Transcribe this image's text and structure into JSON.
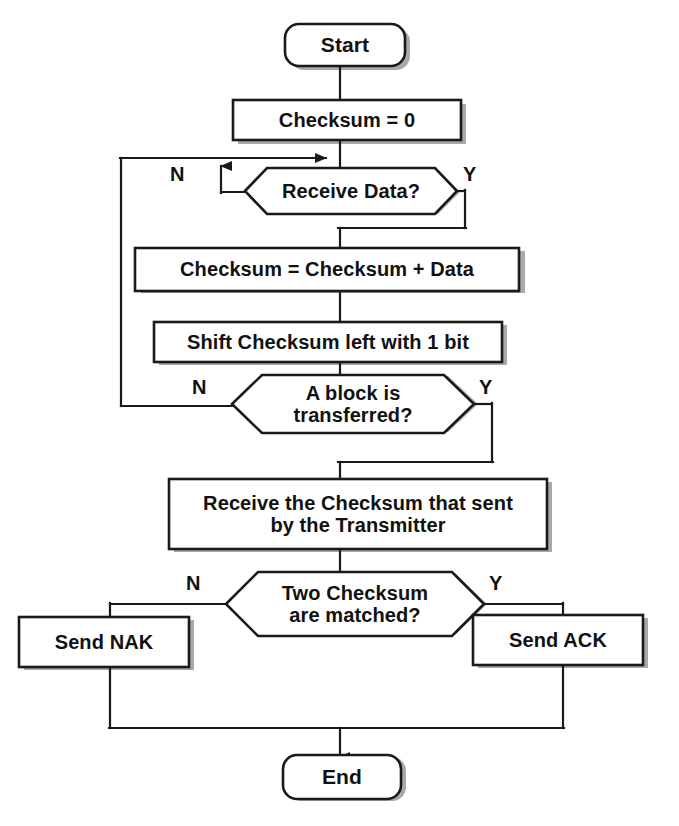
{
  "diagram": {
    "type": "flowchart",
    "colors": {
      "stroke": "#1a1a1a",
      "fill": "#ffffff",
      "shadow": "#a8a8a8",
      "text": "#111111"
    }
  },
  "nodes": {
    "start": {
      "label": "Start",
      "shape": "terminator"
    },
    "init_checksum": {
      "label": "Checksum = 0",
      "shape": "process"
    },
    "receive_data": {
      "label": "Receive Data?",
      "shape": "decision"
    },
    "add_data": {
      "label": "Checksum = Checksum + Data",
      "shape": "process"
    },
    "shift_left": {
      "label": "Shift Checksum left with 1 bit",
      "shape": "process"
    },
    "block_transferred": {
      "label": "A block is\ntransferred?",
      "shape": "decision"
    },
    "receive_checksum": {
      "label": "Receive the Checksum that sent\nby the Transmitter",
      "shape": "process"
    },
    "two_checksum": {
      "label": "Two Checksum\nare matched?",
      "shape": "decision"
    },
    "send_nak": {
      "label": "Send NAK",
      "shape": "process"
    },
    "send_ack": {
      "label": "Send ACK",
      "shape": "process"
    },
    "end": {
      "label": "End",
      "shape": "terminator"
    }
  },
  "branch_labels": {
    "receive_data_no": "N",
    "receive_data_yes": "Y",
    "block_transferred_no": "N",
    "block_transferred_yes": "Y",
    "two_checksum_no": "N",
    "two_checksum_yes": "Y"
  }
}
